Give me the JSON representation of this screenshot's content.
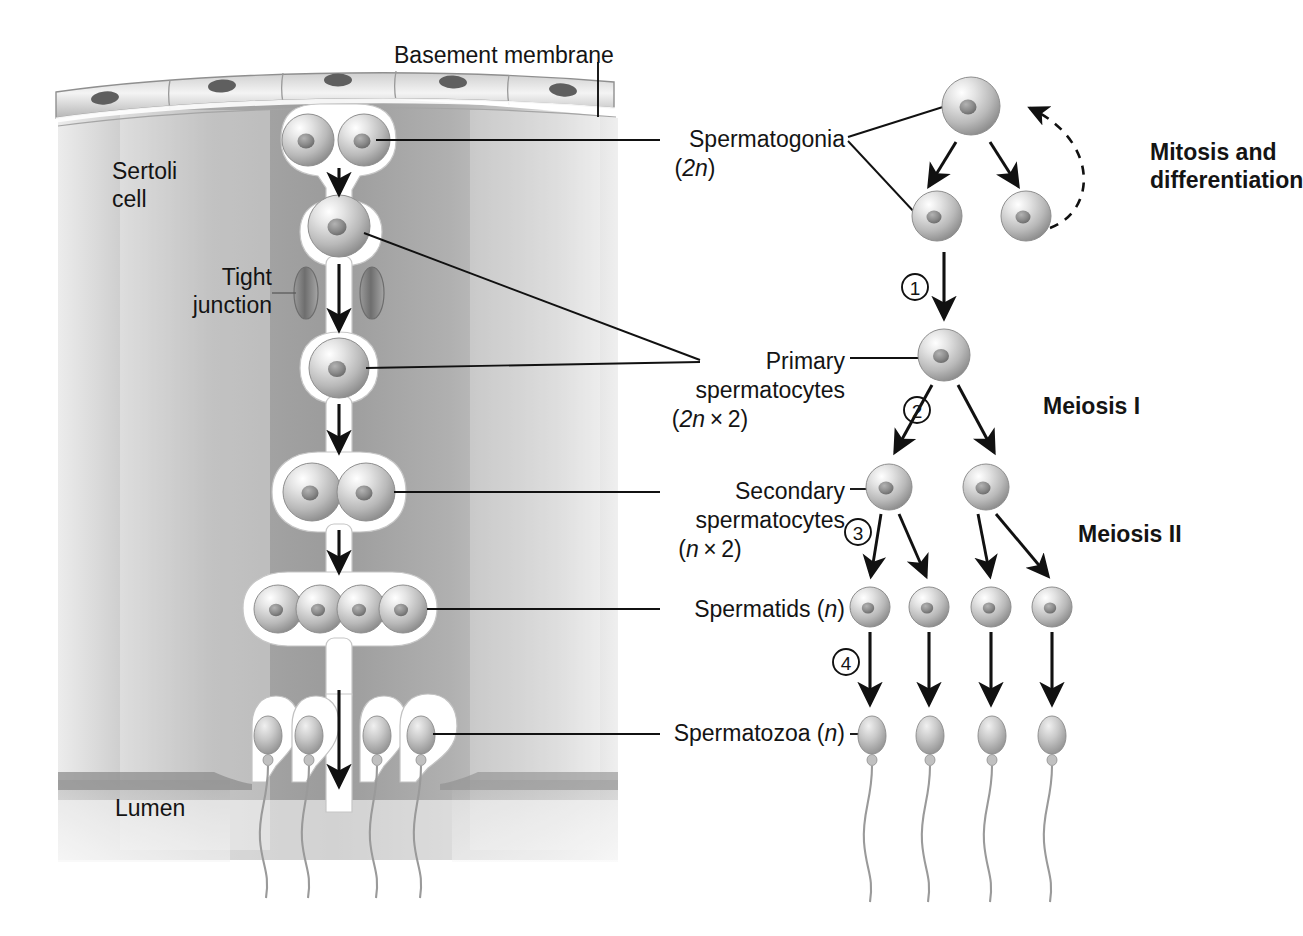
{
  "figure": {
    "type": "biological-diagram"
  },
  "colors": {
    "ink": "#141414",
    "background": "#ffffff",
    "cell_light": "#f2f2f2",
    "cell_mid": "#b8b8b8",
    "cell_dark": "#6e6e6e",
    "nucleus": "#7a7a7a",
    "sertoli_fill": "#b4b4b4",
    "membrane_fill": "#d8d8d8",
    "tail_stroke": "#9a9a9a"
  },
  "left_panel": {
    "labels": [
      {
        "id": "basement-membrane",
        "text": "Basement membrane",
        "x": 494,
        "y": 42
      },
      {
        "id": "sertoli-cell",
        "line1": "Sertoli",
        "line2": "cell",
        "x": 112,
        "y": 160
      },
      {
        "id": "tight-junction",
        "line1": "Tight",
        "line2": "junction",
        "x": 192,
        "y": 266
      },
      {
        "id": "lumen",
        "text": "Lumen",
        "x": 115,
        "y": 795
      }
    ]
  },
  "center_labels": [
    {
      "id": "spermatogonia",
      "line1": "Spermatogonia",
      "line2": "(2n)",
      "ploidy_italic": "2n",
      "x_right": 845,
      "y": 128
    },
    {
      "id": "primary-spermatocytes",
      "line1": "Primary",
      "line2": "spermatocytes",
      "line3": "(2n × 2)",
      "ploidy_italic": "2n",
      "x_right": 845,
      "y": 350
    },
    {
      "id": "secondary-spermatocytes",
      "line1": "Secondary",
      "line2": "spermatocytes",
      "line3": "(n × 2)",
      "ploidy_italic": "n",
      "x_right": 845,
      "y": 480
    },
    {
      "id": "spermatids",
      "line1": "Spermatids (n)",
      "ploidy_italic": "n",
      "x_right": 845,
      "y": 607
    },
    {
      "id": "spermatozoa",
      "line1": "Spermatozoa (n)",
      "ploidy_italic": "n",
      "x_right": 845,
      "y": 730
    }
  ],
  "right_panel": {
    "process_labels": [
      {
        "id": "mitosis-differentiation",
        "line1": "Mitosis and",
        "line2": "differentiation",
        "x": 1150,
        "y": 150,
        "bold": true
      },
      {
        "id": "meiosis-1",
        "text": "Meiosis I",
        "x": 1043,
        "y": 405,
        "bold": true
      },
      {
        "id": "meiosis-2",
        "text": "Meiosis II",
        "x": 1078,
        "y": 533,
        "bold": true
      }
    ],
    "step_markers": [
      {
        "id": "step-1",
        "number": "1",
        "cx": 915,
        "cy": 287
      },
      {
        "id": "step-2",
        "number": "2",
        "cx": 917,
        "cy": 410
      },
      {
        "id": "step-3",
        "number": "3",
        "cx": 858,
        "cy": 532
      },
      {
        "id": "step-4",
        "number": "4",
        "cx": 846,
        "cy": 662
      }
    ],
    "stages": [
      {
        "id": "stage-spermatogonium-stem",
        "label": "spermatogonium (stem)",
        "count": 1,
        "row_y": 106,
        "cells": [
          {
            "cx": 971,
            "r": 29
          }
        ]
      },
      {
        "id": "stage-spermatogonia-daughters",
        "label": "spermatogonia (daughters)",
        "count": 2,
        "row_y": 216,
        "cells": [
          {
            "cx": 937,
            "r": 25
          },
          {
            "cx": 1026,
            "r": 25
          }
        ]
      },
      {
        "id": "stage-primary-spermatocyte",
        "label": "primary spermatocyte",
        "count": 1,
        "row_y": 355,
        "cells": [
          {
            "cx": 944,
            "r": 26
          }
        ]
      },
      {
        "id": "stage-secondary-spermatocytes",
        "label": "secondary spermatocytes",
        "count": 2,
        "row_y": 487,
        "cells": [
          {
            "cx": 889,
            "r": 23
          },
          {
            "cx": 986,
            "r": 23
          }
        ]
      },
      {
        "id": "stage-spermatids",
        "label": "spermatids",
        "count": 4,
        "row_y": 607,
        "cells": [
          {
            "cx": 870,
            "r": 20
          },
          {
            "cx": 929,
            "r": 20
          },
          {
            "cx": 991,
            "r": 20
          },
          {
            "cx": 1052,
            "r": 20
          }
        ]
      },
      {
        "id": "stage-spermatozoa",
        "label": "spermatozoa",
        "count": 4,
        "row_y": 735,
        "cells": [
          {
            "cx": 872,
            "r": 13
          },
          {
            "cx": 930,
            "r": 13
          },
          {
            "cx": 992,
            "r": 13
          },
          {
            "cx": 1052,
            "r": 13
          }
        ]
      }
    ],
    "recycle_arrow": {
      "id": "mitosis-recycle-arrow",
      "style": "dashed-curve",
      "from": "right daughter spermatogonium",
      "to": "stem spermatogonium"
    }
  },
  "tubule": {
    "id": "seminiferous-tubule-cross-section",
    "germ_cell_rows": [
      {
        "id": "tubule-spermatogonia",
        "count": 2,
        "y": 140,
        "xs": [
          308,
          363
        ]
      },
      {
        "id": "tubule-primary-spermatocyte",
        "count": 1,
        "y": 225,
        "xs": [
          338
        ]
      },
      {
        "id": "tubule-secondary-spermatocyte",
        "count": 1,
        "y": 365,
        "xs": [
          338
        ]
      },
      {
        "id": "tubule-secondary-pair",
        "count": 2,
        "y": 490,
        "xs": [
          310,
          365
        ]
      },
      {
        "id": "tubule-spermatids",
        "count": 4,
        "y": 608,
        "xs": [
          277,
          320,
          362,
          404
        ]
      },
      {
        "id": "tubule-spermatozoa",
        "count": 4,
        "y": 733,
        "xs": [
          268,
          309,
          377,
          419
        ]
      }
    ],
    "migration_arrows": 5,
    "tight_junction_pair_y": 293
  }
}
